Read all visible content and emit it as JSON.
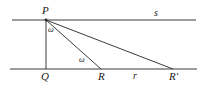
{
  "figure": {
    "type": "geometry-diagram",
    "width": 203,
    "height": 91,
    "stroke_color": "#3c3c3c",
    "label_color": "#1a1a1a",
    "background": "#ffffff",
    "lines": {
      "line_s": {
        "name": "s",
        "label": "s",
        "x1": 12,
        "y1": 20,
        "x2": 196,
        "y2": 20
      },
      "base_line": {
        "name": "base",
        "label": "",
        "x1": 10,
        "y1": 69,
        "x2": 197,
        "y2": 69
      }
    },
    "points": {
      "P": {
        "label": "P",
        "x": 46,
        "y": 20
      },
      "Q": {
        "label": "Q",
        "x": 46,
        "y": 69
      },
      "R": {
        "label": "R",
        "x": 101,
        "y": 69
      },
      "R_prime": {
        "label": "R'",
        "x": 173,
        "y": 69
      }
    },
    "segments": [
      {
        "name": "PQ",
        "from": "P",
        "to": "Q"
      },
      {
        "name": "PR",
        "from": "P",
        "to": "R"
      },
      {
        "name": "PR-prime",
        "from": "P",
        "to": "R_prime"
      },
      {
        "name": "QR-prime-on-base",
        "from": "Q",
        "to": "R_prime"
      }
    ],
    "segment_labels": {
      "r": {
        "label": "r",
        "between": "R to R'",
        "x": 133,
        "y": 71
      }
    },
    "angles": {
      "omega_at_P": {
        "label": "ω",
        "vertex": "P",
        "between": "PQ and PR",
        "x": 48,
        "y": 26
      },
      "omega_at_R": {
        "label": "ω",
        "vertex": "R",
        "between": "RQ and RP",
        "x": 79,
        "y": 56
      }
    }
  }
}
